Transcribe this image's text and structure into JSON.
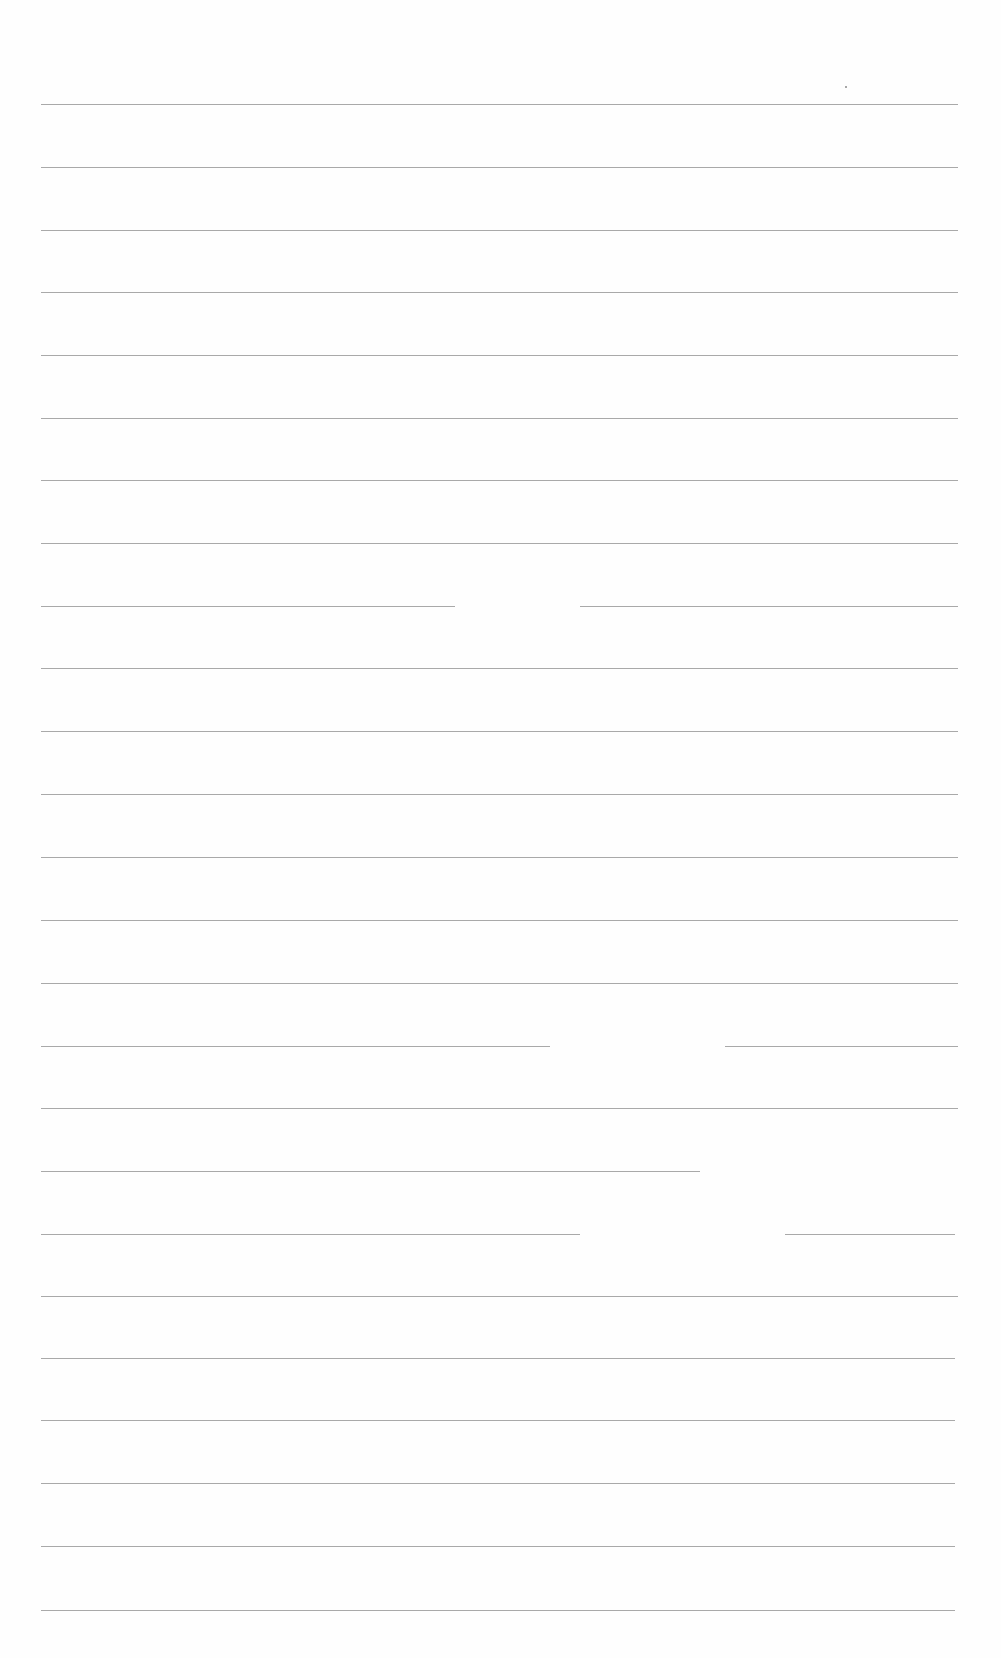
{
  "document": {
    "type": "blank lined sheet",
    "background": "#fefefe",
    "rule_color": "#9a9a9a",
    "rule_count": 25,
    "margin_left": 41,
    "margin_right": 958,
    "rules": [
      {
        "y": 104,
        "segments": [
          [
            41,
            958
          ]
        ]
      },
      {
        "y": 167,
        "segments": [
          [
            41,
            958
          ]
        ]
      },
      {
        "y": 230,
        "segments": [
          [
            41,
            958
          ]
        ]
      },
      {
        "y": 292,
        "segments": [
          [
            41,
            958
          ]
        ]
      },
      {
        "y": 355,
        "segments": [
          [
            41,
            958
          ]
        ]
      },
      {
        "y": 418,
        "segments": [
          [
            41,
            958
          ]
        ]
      },
      {
        "y": 480,
        "segments": [
          [
            41,
            958
          ]
        ]
      },
      {
        "y": 543,
        "segments": [
          [
            41,
            958
          ]
        ]
      },
      {
        "y": 606,
        "segments": [
          [
            41,
            455
          ],
          [
            580,
            958
          ]
        ]
      },
      {
        "y": 668,
        "segments": [
          [
            41,
            958
          ]
        ]
      },
      {
        "y": 731,
        "segments": [
          [
            41,
            958
          ]
        ]
      },
      {
        "y": 794,
        "segments": [
          [
            41,
            958
          ]
        ]
      },
      {
        "y": 857,
        "segments": [
          [
            41,
            958
          ]
        ]
      },
      {
        "y": 920,
        "segments": [
          [
            41,
            958
          ]
        ]
      },
      {
        "y": 983,
        "segments": [
          [
            41,
            958
          ]
        ]
      },
      {
        "y": 1046,
        "segments": [
          [
            41,
            550
          ],
          [
            725,
            958
          ]
        ]
      },
      {
        "y": 1108,
        "segments": [
          [
            41,
            958
          ]
        ]
      },
      {
        "y": 1171,
        "segments": [
          [
            41,
            700
          ]
        ]
      },
      {
        "y": 1234,
        "segments": [
          [
            41,
            580
          ],
          [
            785,
            955
          ]
        ]
      },
      {
        "y": 1296,
        "segments": [
          [
            41,
            958
          ]
        ]
      },
      {
        "y": 1358,
        "segments": [
          [
            41,
            955
          ]
        ]
      },
      {
        "y": 1420,
        "segments": [
          [
            41,
            955
          ]
        ]
      },
      {
        "y": 1483,
        "segments": [
          [
            41,
            955
          ]
        ]
      },
      {
        "y": 1546,
        "segments": [
          [
            41,
            955
          ]
        ]
      },
      {
        "y": 1610,
        "segments": [
          [
            41,
            955
          ]
        ]
      }
    ],
    "specks": [
      {
        "x": 845,
        "y": 86
      }
    ]
  }
}
